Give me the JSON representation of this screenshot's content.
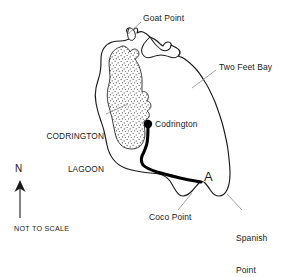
{
  "map": {
    "title": "Barbuda",
    "scale_note": "NOT TO SCALE",
    "compass": {
      "label": "N",
      "icon": "north-arrow-icon",
      "direction": "up"
    },
    "colors": {
      "coastline": "#1a1a1a",
      "lagoon_fill": "#ffffff",
      "lagoon_stipple": "#555555",
      "road": "#000000",
      "background": "#ffffff",
      "text": "#1a1a1a",
      "leader_line": "#888888"
    },
    "labels": [
      {
        "id": "goat-point",
        "text": "Goat Point",
        "lines": [
          "Goat Point"
        ],
        "type": "place"
      },
      {
        "id": "two-feet-bay",
        "text": "Two Feet Bay",
        "lines": [
          "Two Feet Bay"
        ],
        "type": "bay"
      },
      {
        "id": "codrington-lagoon",
        "text": "CODRINGTON LAGOON",
        "lines": [
          "CODRINGTON",
          "LAGOON"
        ],
        "type": "lagoon"
      },
      {
        "id": "codrington",
        "text": "Codrington",
        "lines": [
          "Codrington"
        ],
        "type": "settlement"
      },
      {
        "id": "coco-point",
        "text": "Coco Point",
        "lines": [
          "Coco Point"
        ],
        "type": "place"
      },
      {
        "id": "spanish-point",
        "text": "Spanish Point",
        "lines": [
          "Spanish",
          "Point"
        ],
        "type": "place"
      },
      {
        "id": "route-a",
        "text": "A",
        "lines": [
          "A"
        ],
        "type": "route-marker"
      }
    ],
    "label_text": {
      "goat_point": "Goat Point",
      "two_feet_bay": "Two Feet Bay",
      "codrington_lagoon_line1": "CODRINGTON",
      "codrington_lagoon_line2": "LAGOON",
      "codrington": "Codrington",
      "coco_point": "Coco Point",
      "spanish_point_line1": "Spanish",
      "spanish_point_line2": "Point",
      "route_a": "A",
      "north": "N",
      "not_to_scale": "NOT TO SCALE"
    },
    "features": {
      "settlement_marker": "codrington-dot",
      "road": "road-codrington-to-point-a",
      "lagoon": "codrington-lagoon-polygon",
      "coastline": "barbuda-coastline"
    }
  }
}
